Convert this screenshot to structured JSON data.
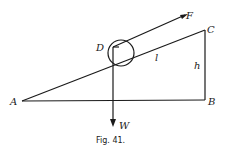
{
  "figure": {
    "caption": "Fig. 41.",
    "labels": {
      "A": "A",
      "B": "B",
      "C": "C",
      "D": "D",
      "F": "F",
      "W": "W",
      "l": "l",
      "h": "h"
    }
  }
}
